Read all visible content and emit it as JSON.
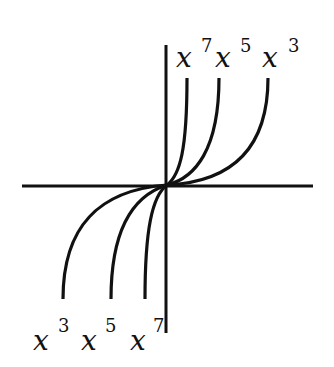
{
  "diagram": {
    "axes": {
      "color": "#111111"
    },
    "curves": [
      {
        "name": "x^7",
        "exponent": 7
      },
      {
        "name": "x^5",
        "exponent": 5
      },
      {
        "name": "x^3",
        "exponent": 3
      }
    ],
    "top_labels": [
      {
        "base": "x",
        "exp": "7"
      },
      {
        "base": "x",
        "exp": "5"
      },
      {
        "base": "x",
        "exp": "3"
      }
    ],
    "bottom_labels": [
      {
        "base": "x",
        "exp": "3"
      },
      {
        "base": "x",
        "exp": "5"
      },
      {
        "base": "x",
        "exp": "7"
      }
    ]
  }
}
